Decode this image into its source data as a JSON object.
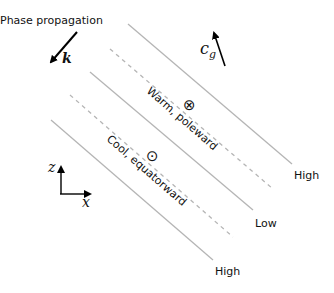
{
  "diagram": {
    "phase_label": "Phase propagation",
    "k_label": "k",
    "cg_label": "c",
    "cg_sub": "g",
    "warm_label": "Warm, poleward",
    "cool_label": "Cool, equatorward",
    "into_page_symbol": "⊗",
    "out_of_page_symbol": "⊙",
    "high_top_label": "High",
    "low_label": "Low",
    "high_bottom_label": "High",
    "axis_z_label": "z",
    "axis_x_label": "x",
    "colors": {
      "line": "#b5b5b5",
      "dashed": "#b5b5b5",
      "text": "#111111",
      "arrow": "#000000"
    }
  }
}
